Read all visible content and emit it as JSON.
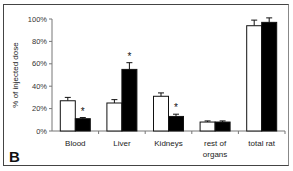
{
  "panel_label": "B",
  "chart_data": {
    "type": "bar",
    "title": "",
    "xlabel": "",
    "ylabel": "% of injected dose",
    "ylim": [
      0,
      100
    ],
    "yticks": [
      "0%",
      "20%",
      "40%",
      "60%",
      "80%",
      "100%"
    ],
    "categories": [
      "Blood",
      "Liver",
      "Kidneys",
      "rest of organs",
      "total rat"
    ],
    "series": [
      {
        "name": "control",
        "color": "#ffffff",
        "values": [
          27,
          25,
          31,
          8,
          94
        ],
        "errors": [
          3,
          3,
          3,
          1,
          5
        ]
      },
      {
        "name": "treated",
        "color": "#000000",
        "values": [
          11,
          55,
          13,
          8,
          97
        ],
        "errors": [
          1,
          6,
          2,
          1,
          4
        ]
      }
    ],
    "significance": [
      true,
      true,
      true,
      false,
      false
    ],
    "significance_marker": "*",
    "grid": false,
    "legend": "none"
  }
}
